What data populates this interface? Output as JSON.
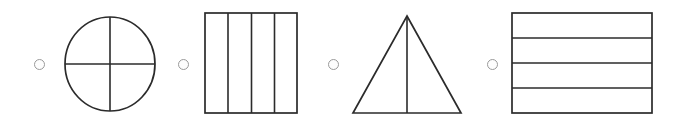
{
  "figure": {
    "name": "equal-parts-multiple-choice-figure",
    "background_color": "#ffffff",
    "stroke_color": "#2b2b2b",
    "radio_color": "#9a9a9a",
    "width": 678,
    "height": 130
  },
  "options": [
    {
      "id": "option-a",
      "radio": {
        "name": "radio-option-a",
        "selected": false,
        "cx": 39,
        "cy": 64,
        "r": 5.5
      },
      "shape": {
        "name": "circle-divided-into-quarters",
        "type": "circle",
        "parts": 4,
        "division": "cross",
        "equal_parts": true,
        "cx": 110,
        "cy": 64,
        "rx": 45,
        "ry": 47
      }
    },
    {
      "id": "option-b",
      "radio": {
        "name": "radio-option-b",
        "selected": false,
        "cx": 183,
        "cy": 64,
        "r": 5.5
      },
      "shape": {
        "name": "square-divided-into-vertical-strips",
        "type": "rectangle",
        "parts": 4,
        "division": "vertical",
        "equal_parts": true,
        "x": 205,
        "y": 13,
        "width": 92,
        "height": 100,
        "dividers": [
          228,
          251.5,
          274.5
        ]
      }
    },
    {
      "id": "option-c",
      "radio": {
        "name": "radio-option-c",
        "selected": false,
        "cx": 333,
        "cy": 64,
        "r": 5.5
      },
      "shape": {
        "name": "triangle-divided-into-halves",
        "type": "triangle",
        "parts": 2,
        "division": "vertical-median",
        "equal_parts": true,
        "apex_x": 407,
        "apex_y": 16,
        "base_left_x": 353,
        "base_right_x": 461,
        "base_y": 113
      }
    },
    {
      "id": "option-d",
      "radio": {
        "name": "radio-option-d",
        "selected": false,
        "cx": 492,
        "cy": 64,
        "r": 5.5
      },
      "shape": {
        "name": "rectangle-divided-into-horizontal-strips",
        "type": "rectangle",
        "parts": 4,
        "division": "horizontal",
        "equal_parts": true,
        "x": 512,
        "y": 13,
        "width": 140,
        "height": 100,
        "dividers": [
          38,
          63,
          88
        ]
      }
    }
  ]
}
